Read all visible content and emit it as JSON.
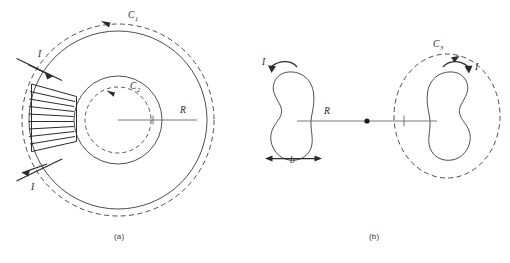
{
  "figure": {
    "panels": [
      {
        "id": "a",
        "caption": "(a)",
        "description": "toroid-like coil with concentric circles and Amperian loops",
        "labels": {
          "loop_outer": "C",
          "loop_outer_sub": "1",
          "loop_inner": "C",
          "loop_inner_sub": "2",
          "radius": "R",
          "current_in": "I",
          "current_out": "I"
        }
      },
      {
        "id": "b",
        "caption": "(b)",
        "description": "two bean shaped current loops separated by distance R with Amperian loop C3",
        "labels": {
          "loop_amperian": "C",
          "loop_amperian_sub": "3",
          "separation": "R",
          "width": "b",
          "current_left": "I",
          "current_right": "I"
        }
      }
    ],
    "colors": {
      "line": "#3a3a3a",
      "wire": "#2b2b2b",
      "axis": "#6a6a6a",
      "text": "#1f1f1f",
      "caption": "#3c3c3c",
      "background": "#ffffff"
    }
  }
}
